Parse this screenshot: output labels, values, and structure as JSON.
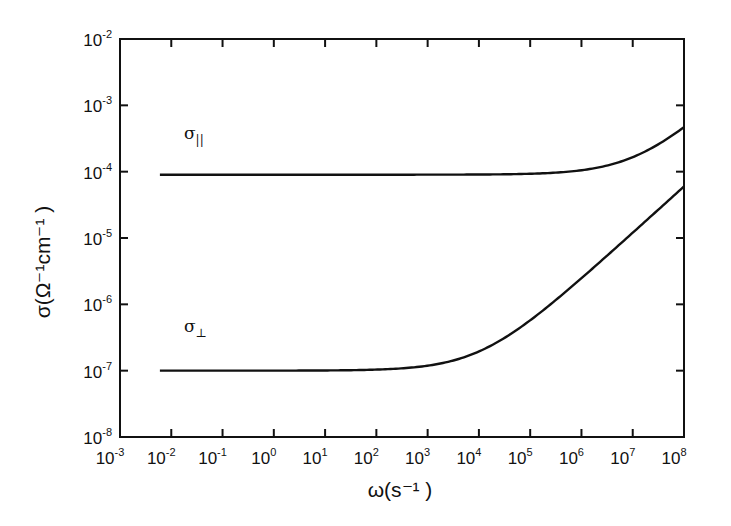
{
  "chart_data": {
    "type": "line",
    "title": "",
    "xlabel": "ω(s⁻¹ )",
    "ylabel": "σ(Ω⁻¹cm⁻¹ )",
    "xscale": "log",
    "yscale": "log",
    "xlim": [
      0.001,
      100000000
    ],
    "ylim": [
      1e-08,
      0.01
    ],
    "grid": false,
    "legend": "inline labels",
    "x_ticks": [
      {
        "base": "10",
        "exp": "-3"
      },
      {
        "base": "10",
        "exp": "-2"
      },
      {
        "base": "10",
        "exp": "-1"
      },
      {
        "base": "10",
        "exp": "0"
      },
      {
        "base": "10",
        "exp": "1"
      },
      {
        "base": "10",
        "exp": "2"
      },
      {
        "base": "10",
        "exp": "3"
      },
      {
        "base": "10",
        "exp": "4"
      },
      {
        "base": "10",
        "exp": "5"
      },
      {
        "base": "10",
        "exp": "6"
      },
      {
        "base": "10",
        "exp": "7"
      },
      {
        "base": "10",
        "exp": "8"
      }
    ],
    "y_ticks": [
      {
        "base": "10",
        "exp": "-2"
      },
      {
        "base": "10",
        "exp": "-3"
      },
      {
        "base": "10",
        "exp": "-4"
      },
      {
        "base": "10",
        "exp": "-5"
      },
      {
        "base": "10",
        "exp": "-6"
      },
      {
        "base": "10",
        "exp": "-7"
      },
      {
        "base": "10",
        "exp": "-8"
      }
    ],
    "x": [
      0.006,
      0.01,
      0.1,
      1,
      10,
      100,
      1000,
      10000,
      100000,
      1000000,
      10000000,
      100000000
    ],
    "series": [
      {
        "name": "σ∥",
        "label_main": "σ",
        "label_sub": "||",
        "model": {
          "sigma0": 9e-05,
          "A": 9.5e-10,
          "n": 0.7
        },
        "values": [
          9e-05,
          9e-05,
          9e-05,
          9e-05,
          9e-05,
          9e-05,
          9.01e-05,
          9.06e-05,
          9.3e-05,
          0.000105,
          0.000165,
          0.00047
        ]
      },
      {
        "name": "σ⊥",
        "label_main": "σ",
        "label_sub": "⊥",
        "model": {
          "sigma0": 1e-07,
          "A": 1.5e-10,
          "n": 0.7
        },
        "values": [
          1e-07,
          1e-07,
          1e-07,
          1e-07,
          1e-07,
          1.04e-07,
          1.19e-07,
          1.95e-07,
          6e-07,
          2.48e-06,
          1.2e-05,
          6e-05
        ]
      }
    ]
  }
}
